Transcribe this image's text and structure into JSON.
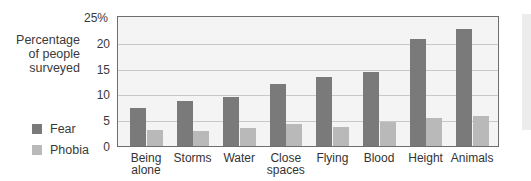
{
  "chart_data": {
    "type": "bar",
    "title": "",
    "ylabel": "Percentage of people surveyed",
    "xlabel": "",
    "ylim": [
      0,
      25
    ],
    "yticks": [
      "0",
      "5",
      "10",
      "15",
      "20",
      "25%"
    ],
    "grid": true,
    "legend_position": "left",
    "categories": [
      "Being alone",
      "Storms",
      "Water",
      "Close spaces",
      "Flying",
      "Blood",
      "Height",
      "Animals"
    ],
    "series": [
      {
        "name": "Fear",
        "color": "#7a7a7a",
        "values": [
          7.4,
          8.8,
          9.5,
          12.1,
          13.4,
          14.3,
          20.7,
          22.7
        ]
      },
      {
        "name": "Phobia",
        "color": "#b9b9b9",
        "values": [
          3.1,
          2.9,
          3.5,
          4.3,
          3.6,
          4.6,
          5.5,
          5.9
        ]
      }
    ]
  },
  "labels": {
    "ylabel_lines": [
      "Percentage",
      "of people",
      "surveyed"
    ],
    "legend": [
      "Fear",
      "Phobia"
    ],
    "categories_display": [
      [
        "Being",
        "alone"
      ],
      [
        "Storms"
      ],
      [
        "Water"
      ],
      [
        "Close",
        "spaces"
      ],
      [
        "Flying"
      ],
      [
        "Blood"
      ],
      [
        "Height"
      ],
      [
        "Animals"
      ]
    ]
  }
}
